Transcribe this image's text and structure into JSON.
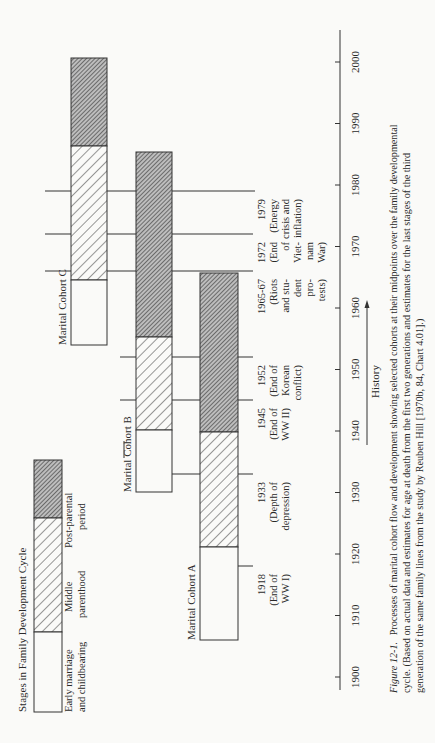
{
  "chart_data": {
    "type": "bar",
    "orientation": "rotated-90-ccw",
    "title": "Stages in Family Development Cycle",
    "xlabel": "History",
    "x_axis": {
      "range": [
        1900,
        2000
      ],
      "ticks": [
        1900,
        1910,
        1920,
        1930,
        1940,
        1950,
        1960,
        1970,
        1980,
        1990,
        2000
      ]
    },
    "legend": [
      {
        "key": "early",
        "label_lines": [
          "Early marriage",
          "and childbearing"
        ],
        "pattern": "white"
      },
      {
        "key": "middle",
        "label_lines": [
          "Middle",
          "parenthood"
        ],
        "pattern": "light-hatch"
      },
      {
        "key": "post",
        "label_lines": [
          "Post-parental",
          "period"
        ],
        "pattern": "dark-hatch"
      }
    ],
    "series": [
      {
        "name": "Marital Cohort A",
        "segments": [
          {
            "stage": "early",
            "start": 1915,
            "end": 1920
          },
          {
            "stage": "middle",
            "start": 1920,
            "end": 1941
          },
          {
            "stage": "post",
            "start": 1941,
            "end": 1966
          }
        ]
      },
      {
        "name": "Marital Cohort B",
        "segments": [
          {
            "stage": "early",
            "start": 1930,
            "end": 1940
          },
          {
            "stage": "middle",
            "start": 1940,
            "end": 1955
          },
          {
            "stage": "post",
            "start": 1955,
            "end": 1985
          }
        ]
      },
      {
        "name": "Marital Cohort C",
        "segments": [
          {
            "stage": "early",
            "start": 1954,
            "end": 1964
          },
          {
            "stage": "middle",
            "start": 1964,
            "end": 1986
          },
          {
            "stage": "post",
            "start": 1986,
            "end": 2000
          }
        ]
      }
    ],
    "events": [
      {
        "year": 1918,
        "y": 566,
        "lines": [
          "1918",
          "(End of",
          "WW I)"
        ]
      },
      {
        "year": 1933,
        "y": 474,
        "lines": [
          "1933",
          "(Depth of",
          "depression)"
        ]
      },
      {
        "year": 1945,
        "y": 400,
        "lines": [
          "1945",
          "(End of",
          "WW II)"
        ]
      },
      {
        "year": 1952,
        "y": 357,
        "lines": [
          "1952",
          "(End of",
          "Korean",
          "conflict)"
        ]
      },
      {
        "year": 1966,
        "y": 271,
        "lines": [
          "1965-67",
          "(Riots",
          "and stu-",
          "dent",
          "pro-",
          "tests)"
        ]
      },
      {
        "year": 1972,
        "y": 234,
        "lines": [
          "1972",
          "(End",
          "of",
          "Viet-",
          "nam",
          "War)"
        ]
      },
      {
        "year": 1979,
        "y": 191,
        "lines": [
          "1979",
          "(Energy",
          "crisis and",
          "inflation)"
        ]
      }
    ]
  },
  "legend_title": "Stages in Family Development Cycle",
  "cohort_labels": {
    "a": "Marital Cohort A",
    "b": "Marital Cohort B",
    "c": "Marital Cohort C"
  },
  "history_label": "History",
  "caption": {
    "figure_label": "Figure 12-1.",
    "line1": "Processes of marital cohort flow and development showing selected cohorts at their midpoints over the family developmental",
    "line2": "cycle. (Based on actual data and estimates for age at death from the first two generations and estimates for the last stages of the third",
    "line3": "generation of the same family lines from the study by Reuben Hill [1970b, 84, Chart 4.01].)"
  },
  "colors": {
    "ink": "#2a2a2a",
    "paper": "#fafaf8"
  }
}
